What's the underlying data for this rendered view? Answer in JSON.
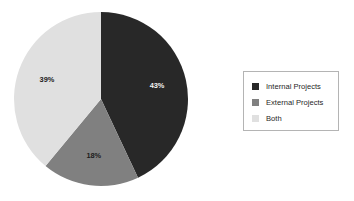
{
  "chart_data": {
    "type": "pie",
    "title": "",
    "categories": [
      "Internal Projects",
      "External Projects",
      "Both"
    ],
    "values": [
      43,
      18,
      39
    ],
    "value_labels": [
      "43%",
      "18%",
      "39%"
    ],
    "unit": "percent",
    "total": 100,
    "start_angle_deg": 0,
    "direction": "clockwise",
    "colors": [
      "#282828",
      "#808080",
      "#e0e0e0"
    ],
    "label_text_colors": [
      "#f2f2f2",
      "#1c1c1c",
      "#1c1c1c"
    ],
    "legend": {
      "position": "right",
      "bordered": true,
      "border_color": "#b4b4b4",
      "entries": [
        {
          "label": "Internal Projects",
          "color": "#282828"
        },
        {
          "label": "External Projects",
          "color": "#808080"
        },
        {
          "label": "Both",
          "color": "#e0e0e0"
        }
      ]
    },
    "geometry": {
      "center_x": 101,
      "center_y": 99,
      "radius": 87
    }
  },
  "background_color": "#ffffff"
}
